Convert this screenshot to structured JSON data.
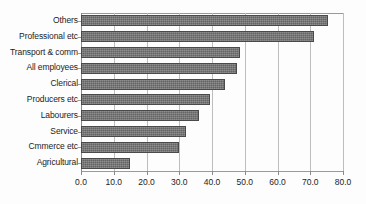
{
  "chart_data": {
    "type": "bar",
    "orientation": "horizontal",
    "title": "",
    "subtitle": "",
    "xlabel": "",
    "ylabel": "",
    "categories": [
      "Others",
      "Professional etc",
      "Transport & comm",
      "All employees",
      "Clerical",
      "Producers etc",
      "Labourers",
      "Service",
      "Cmmerce etc",
      "Agricultural"
    ],
    "values": [
      75.5,
      71.0,
      48.5,
      47.5,
      44.0,
      39.5,
      36.0,
      32.0,
      30.0,
      15.0
    ],
    "xlim": [
      0.0,
      80.0
    ],
    "xticks": [
      0.0,
      10.0,
      20.0,
      30.0,
      40.0,
      50.0,
      60.0,
      70.0,
      80.0
    ],
    "xtick_labels": [
      "0.0",
      "10.0",
      "20.0",
      "30.0",
      "40.0",
      "50.0",
      "60.0",
      "70.0",
      "80.0"
    ],
    "grid": "vertical",
    "legend": null,
    "legend_position": "none",
    "annotations": [],
    "colors": {
      "bar_fill": "#737373",
      "bar_edge": "#4a4a4a",
      "gridline": "#bdbdbd",
      "axis": "#8a8a8a",
      "text": "#1c1c1c",
      "background": "#fdfdfd"
    }
  }
}
